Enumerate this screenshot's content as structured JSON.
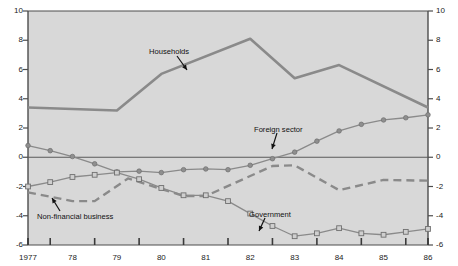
{
  "chart_data": {
    "type": "line",
    "title": "",
    "subtitle": "",
    "xlabel": "",
    "ylabel": "",
    "xlim": [
      1977,
      1986
    ],
    "ylim": [
      -6,
      10
    ],
    "grid": false,
    "legend_position": "inline-annotations",
    "x": [
      1977,
      1977.5,
      1978,
      1978.5,
      1979,
      1979.5,
      1980,
      1980.5,
      1981,
      1981.5,
      1982,
      1982.5,
      1983,
      1983.5,
      1984,
      1984.5,
      1985,
      1985.5,
      1986
    ],
    "x_tick_labels": [
      "1977",
      "78",
      "79",
      "80",
      "81",
      "82",
      "83",
      "84",
      "85",
      "86"
    ],
    "x_tick_values": [
      1977,
      1978,
      1979,
      1980,
      1981,
      1982,
      1983,
      1984,
      1985,
      1986
    ],
    "y_tick_labels": [
      "10",
      "8",
      "6",
      "4",
      "2",
      "0",
      "-2",
      "-4",
      "-6"
    ],
    "y_tick_values": [
      10,
      8,
      6,
      4,
      2,
      0,
      -2,
      -4,
      -6
    ],
    "series": [
      {
        "name": "Households",
        "label": "Households",
        "style": "solid",
        "marker": "none",
        "color": "#8a8a8a",
        "width": 2.6,
        "x": [
          1977,
          1979,
          1980,
          1982,
          1983,
          1984,
          1986
        ],
        "values": [
          3.4,
          3.2,
          5.7,
          8.1,
          5.4,
          6.3,
          3.4
        ]
      },
      {
        "name": "Foreign sector",
        "label": "Foreign sector",
        "style": "solid",
        "marker": "circle",
        "color": "#8a8a8a",
        "width": 1.3,
        "x": [
          1977,
          1977.5,
          1978,
          1978.5,
          1979,
          1979.5,
          1980,
          1980.5,
          1981,
          1981.5,
          1982,
          1982.5,
          1983,
          1983.5,
          1984,
          1984.5,
          1985,
          1985.5,
          1986
        ],
        "values": [
          0.8,
          0.45,
          0.05,
          -0.45,
          -1.0,
          -0.95,
          -1.05,
          -0.85,
          -0.8,
          -0.85,
          -0.55,
          -0.1,
          0.35,
          1.1,
          1.8,
          2.25,
          2.55,
          2.7,
          2.9
        ]
      },
      {
        "name": "Non-financial business",
        "label": "Non-financial business",
        "style": "dashed",
        "marker": "none",
        "color": "#8a8a8a",
        "width": 2.4,
        "x": [
          1977,
          1978,
          1978.5,
          1979.25,
          1980.5,
          1981,
          1982.5,
          1983,
          1984,
          1985,
          1986
        ],
        "values": [
          -2.4,
          -3.0,
          -3.0,
          -1.45,
          -2.65,
          -2.65,
          -0.6,
          -0.55,
          -2.25,
          -1.55,
          -1.6
        ]
      },
      {
        "name": "Government",
        "label": "Government",
        "style": "solid",
        "marker": "square",
        "color": "#8a8a8a",
        "width": 1.3,
        "x": [
          1977,
          1977.5,
          1978,
          1978.5,
          1979,
          1979.5,
          1980,
          1980.5,
          1981,
          1981.5,
          1982,
          1982.5,
          1983,
          1983.5,
          1984,
          1984.5,
          1985,
          1985.5,
          1986
        ],
        "values": [
          -2.0,
          -1.7,
          -1.35,
          -1.2,
          -1.05,
          -1.5,
          -2.1,
          -2.6,
          -2.6,
          -3.0,
          -3.85,
          -4.7,
          -5.4,
          -5.2,
          -4.85,
          -5.2,
          -5.3,
          -5.1,
          -4.9
        ]
      }
    ],
    "annotations": [
      {
        "text": "Households",
        "x": 149,
        "y": 48
      },
      {
        "text": "Foreign sector",
        "x": 254,
        "y": 126
      },
      {
        "text": "Non-financial business",
        "x": 37,
        "y": 213
      },
      {
        "text": "Government",
        "x": 249,
        "y": 211
      }
    ],
    "colors": {
      "plot_background": "#d8d8d8",
      "line": "#8a8a8a",
      "axis": "#4d4d4d",
      "text": "#111111",
      "page_background": "#ffffff"
    }
  }
}
